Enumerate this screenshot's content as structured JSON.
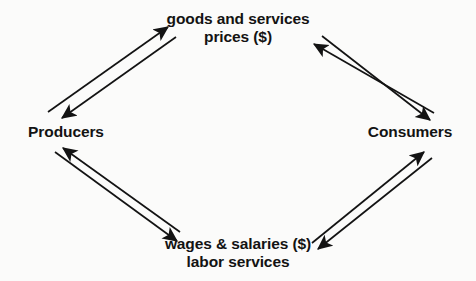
{
  "diagram": {
    "type": "circular-flow",
    "background_color": "#fbfbfa",
    "ink_color": "#131313",
    "nodes": {
      "top": {
        "line1": "goods and services",
        "line2": "prices ($)"
      },
      "bottom": {
        "line1": "wages & salaries ($)",
        "line2": "labor services"
      },
      "left": {
        "line1": "Producers"
      },
      "right": {
        "line1": "Consumers"
      }
    },
    "flows": [
      {
        "name": "producers-to-goods",
        "from": "Producers",
        "to": "goods and services prices ($)",
        "direction": "up-right"
      },
      {
        "name": "goods-to-producers",
        "from": "goods and services prices ($)",
        "to": "Producers",
        "direction": "down-left"
      },
      {
        "name": "goods-to-consumers",
        "from": "goods and services prices ($)",
        "to": "Consumers",
        "direction": "down-right"
      },
      {
        "name": "consumers-to-goods",
        "from": "Consumers",
        "to": "goods and services prices ($)",
        "direction": "up-left"
      },
      {
        "name": "producers-to-wages",
        "from": "Producers",
        "to": "wages & salaries ($) labor services",
        "direction": "down-right"
      },
      {
        "name": "wages-to-producers",
        "from": "wages & salaries ($) labor services",
        "to": "Producers",
        "direction": "up-left"
      },
      {
        "name": "wages-to-consumers",
        "from": "wages & salaries ($) labor services",
        "to": "Consumers",
        "direction": "up-right"
      },
      {
        "name": "consumers-to-wages",
        "from": "Consumers",
        "to": "wages & salaries ($) labor services",
        "direction": "down-left"
      }
    ]
  }
}
